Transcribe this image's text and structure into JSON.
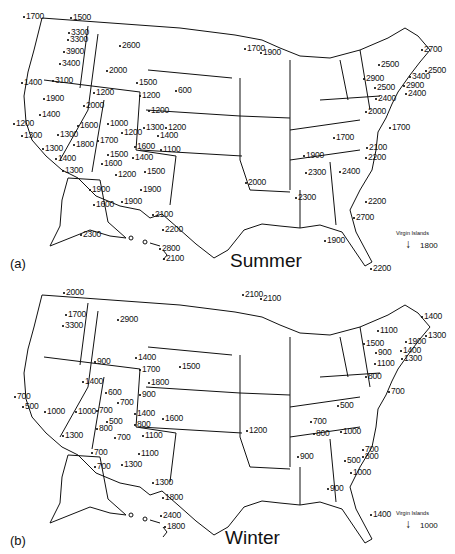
{
  "panels": [
    {
      "id": "a",
      "panel_label": "(a)",
      "season": "Summer",
      "virgin_islands": {
        "label": "Virgin Islands",
        "value": "1800"
      },
      "values": [
        {
          "v": "1700",
          "x": 26,
          "y": 12
        },
        {
          "v": "1500",
          "x": 73,
          "y": 13
        },
        {
          "v": "3300",
          "x": 71,
          "y": 28
        },
        {
          "v": "3300",
          "x": 70,
          "y": 35
        },
        {
          "v": "3900",
          "x": 66,
          "y": 47
        },
        {
          "v": "2600",
          "x": 122,
          "y": 41
        },
        {
          "v": "3400",
          "x": 62,
          "y": 59
        },
        {
          "v": "2000",
          "x": 109,
          "y": 66
        },
        {
          "v": "1400",
          "x": 24,
          "y": 78
        },
        {
          "v": "3100",
          "x": 55,
          "y": 76
        },
        {
          "v": "1500",
          "x": 139,
          "y": 78
        },
        {
          "v": "1200",
          "x": 96,
          "y": 88
        },
        {
          "v": "1200",
          "x": 142,
          "y": 91
        },
        {
          "v": "600",
          "x": 178,
          "y": 86
        },
        {
          "v": "1900",
          "x": 46,
          "y": 94
        },
        {
          "v": "2000",
          "x": 86,
          "y": 101
        },
        {
          "v": "1200",
          "x": 151,
          "y": 106
        },
        {
          "v": "1400",
          "x": 42,
          "y": 110
        },
        {
          "v": "1600",
          "x": 80,
          "y": 121
        },
        {
          "v": "1000",
          "x": 110,
          "y": 119
        },
        {
          "v": "1300",
          "x": 146,
          "y": 123
        },
        {
          "v": "1200",
          "x": 168,
          "y": 123
        },
        {
          "v": "1200",
          "x": 16,
          "y": 119
        },
        {
          "v": "1300",
          "x": 60,
          "y": 130
        },
        {
          "v": "1200",
          "x": 124,
          "y": 128
        },
        {
          "v": "1400",
          "x": 160,
          "y": 131
        },
        {
          "v": "1300",
          "x": 24,
          "y": 131
        },
        {
          "v": "1700",
          "x": 100,
          "y": 136
        },
        {
          "v": "1800",
          "x": 76,
          "y": 140
        },
        {
          "v": "1600",
          "x": 137,
          "y": 142
        },
        {
          "v": "1100",
          "x": 163,
          "y": 145
        },
        {
          "v": "1300",
          "x": 45,
          "y": 144
        },
        {
          "v": "1500",
          "x": 110,
          "y": 150
        },
        {
          "v": "1400",
          "x": 135,
          "y": 153
        },
        {
          "v": "1400",
          "x": 58,
          "y": 154
        },
        {
          "v": "1600",
          "x": 104,
          "y": 159
        },
        {
          "v": "1500",
          "x": 147,
          "y": 167
        },
        {
          "v": "1300",
          "x": 65,
          "y": 166
        },
        {
          "v": "1200",
          "x": 118,
          "y": 170
        },
        {
          "v": "1900",
          "x": 92,
          "y": 185
        },
        {
          "v": "1900",
          "x": 143,
          "y": 185
        },
        {
          "v": "1600",
          "x": 96,
          "y": 200
        },
        {
          "v": "1900",
          "x": 124,
          "y": 197
        },
        {
          "v": "2100",
          "x": 155,
          "y": 210
        },
        {
          "v": "2200",
          "x": 165,
          "y": 225
        },
        {
          "v": "2300",
          "x": 83,
          "y": 230
        },
        {
          "v": "2800",
          "x": 162,
          "y": 244
        },
        {
          "v": "2100",
          "x": 166,
          "y": 254
        },
        {
          "v": "1700",
          "x": 247,
          "y": 44
        },
        {
          "v": "1900",
          "x": 263,
          "y": 48
        },
        {
          "v": "2000",
          "x": 248,
          "y": 178
        },
        {
          "v": "1900",
          "x": 306,
          "y": 151
        },
        {
          "v": "2300",
          "x": 308,
          "y": 168
        },
        {
          "v": "2400",
          "x": 342,
          "y": 167
        },
        {
          "v": "2300",
          "x": 298,
          "y": 193
        },
        {
          "v": "1700",
          "x": 336,
          "y": 133
        },
        {
          "v": "2100",
          "x": 369,
          "y": 143
        },
        {
          "v": "2200",
          "x": 368,
          "y": 153
        },
        {
          "v": "2200",
          "x": 368,
          "y": 197
        },
        {
          "v": "2700",
          "x": 356,
          "y": 213
        },
        {
          "v": "1900",
          "x": 327,
          "y": 236
        },
        {
          "v": "2200",
          "x": 373,
          "y": 264
        },
        {
          "v": "2700",
          "x": 424,
          "y": 45
        },
        {
          "v": "2500",
          "x": 381,
          "y": 60
        },
        {
          "v": "2500",
          "x": 428,
          "y": 66
        },
        {
          "v": "2900",
          "x": 366,
          "y": 74
        },
        {
          "v": "3400",
          "x": 412,
          "y": 72
        },
        {
          "v": "2500",
          "x": 377,
          "y": 83
        },
        {
          "v": "2900",
          "x": 406,
          "y": 81
        },
        {
          "v": "2400",
          "x": 408,
          "y": 89
        },
        {
          "v": "2400",
          "x": 378,
          "y": 94
        },
        {
          "v": "2000",
          "x": 368,
          "y": 107
        },
        {
          "v": "1700",
          "x": 392,
          "y": 123
        }
      ]
    },
    {
      "id": "b",
      "panel_label": "(b)",
      "season": "Winter",
      "virgin_islands": {
        "label": "Virgin Islands",
        "value": "1000"
      },
      "values": [
        {
          "v": "2000",
          "x": 66,
          "y": 11
        },
        {
          "v": "1700",
          "x": 68,
          "y": 33
        },
        {
          "v": "3300",
          "x": 65,
          "y": 44
        },
        {
          "v": "2900",
          "x": 120,
          "y": 38
        },
        {
          "v": "900",
          "x": 97,
          "y": 80
        },
        {
          "v": "1400",
          "x": 138,
          "y": 76
        },
        {
          "v": "1700",
          "x": 142,
          "y": 88
        },
        {
          "v": "1500",
          "x": 182,
          "y": 85
        },
        {
          "v": "1800",
          "x": 151,
          "y": 101
        },
        {
          "v": "1400",
          "x": 85,
          "y": 100
        },
        {
          "v": "700",
          "x": 17,
          "y": 115
        },
        {
          "v": "600",
          "x": 108,
          "y": 111
        },
        {
          "v": "900",
          "x": 142,
          "y": 113
        },
        {
          "v": "500",
          "x": 25,
          "y": 125
        },
        {
          "v": "700",
          "x": 120,
          "y": 121
        },
        {
          "v": "1000",
          "x": 47,
          "y": 130
        },
        {
          "v": "1000",
          "x": 78,
          "y": 130
        },
        {
          "v": "700",
          "x": 99,
          "y": 129
        },
        {
          "v": "1400",
          "x": 137,
          "y": 132
        },
        {
          "v": "1600",
          "x": 165,
          "y": 137
        },
        {
          "v": "500",
          "x": 109,
          "y": 140
        },
        {
          "v": "800",
          "x": 137,
          "y": 143
        },
        {
          "v": "800",
          "x": 99,
          "y": 147
        },
        {
          "v": "700",
          "x": 117,
          "y": 156
        },
        {
          "v": "1100",
          "x": 145,
          "y": 154
        },
        {
          "v": "1300",
          "x": 65,
          "y": 154
        },
        {
          "v": "700",
          "x": 94,
          "y": 171
        },
        {
          "v": "1100",
          "x": 141,
          "y": 172
        },
        {
          "v": "700",
          "x": 97,
          "y": 185
        },
        {
          "v": "1300",
          "x": 124,
          "y": 183
        },
        {
          "v": "1300",
          "x": 155,
          "y": 201
        },
        {
          "v": "1800",
          "x": 165,
          "y": 216
        },
        {
          "v": "2400",
          "x": 163,
          "y": 234
        },
        {
          "v": "1800",
          "x": 167,
          "y": 245
        },
        {
          "v": "2100",
          "x": 245,
          "y": 13
        },
        {
          "v": "2100",
          "x": 263,
          "y": 17
        },
        {
          "v": "1200",
          "x": 249,
          "y": 149
        },
        {
          "v": "500",
          "x": 340,
          "y": 124
        },
        {
          "v": "700",
          "x": 313,
          "y": 140
        },
        {
          "v": "800",
          "x": 316,
          "y": 152
        },
        {
          "v": "1000",
          "x": 343,
          "y": 150
        },
        {
          "v": "900",
          "x": 300,
          "y": 175
        },
        {
          "v": "800",
          "x": 365,
          "y": 175
        },
        {
          "v": "1000",
          "x": 353,
          "y": 191
        },
        {
          "v": "900",
          "x": 330,
          "y": 207
        },
        {
          "v": "1400",
          "x": 373,
          "y": 233
        },
        {
          "v": "500",
          "x": 347,
          "y": 179
        },
        {
          "v": "700",
          "x": 365,
          "y": 168
        },
        {
          "v": "1400",
          "x": 424,
          "y": 35
        },
        {
          "v": "1100",
          "x": 380,
          "y": 49
        },
        {
          "v": "1300",
          "x": 428,
          "y": 54
        },
        {
          "v": "1500",
          "x": 366,
          "y": 62
        },
        {
          "v": "1900",
          "x": 408,
          "y": 60
        },
        {
          "v": "900",
          "x": 378,
          "y": 71
        },
        {
          "v": "1400",
          "x": 403,
          "y": 69
        },
        {
          "v": "1300",
          "x": 404,
          "y": 77
        },
        {
          "v": "1100",
          "x": 377,
          "y": 82
        },
        {
          "v": "800",
          "x": 368,
          "y": 95
        },
        {
          "v": "700",
          "x": 391,
          "y": 110
        }
      ]
    }
  ]
}
